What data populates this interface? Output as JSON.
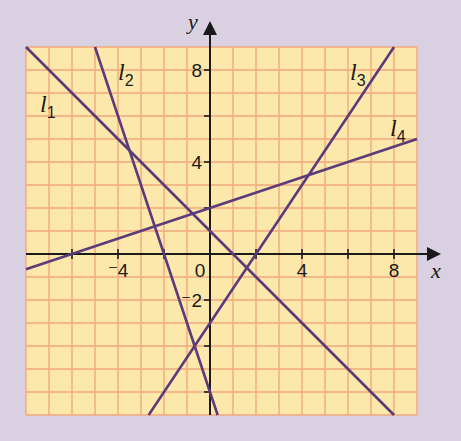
{
  "colors": {
    "background": "#d9d1e1",
    "grid_fill": "#fbe8aa",
    "grid_line": "#f2a97c",
    "axis": "#1a1a1a",
    "plot_line": "#5b3b7c"
  },
  "chart_data": {
    "type": "line",
    "title": "",
    "xlabel": "x",
    "ylabel": "y",
    "xlim": [
      -8,
      9
    ],
    "ylim": [
      -7,
      9
    ],
    "grid": true,
    "x_ticks": [
      -4,
      0,
      4,
      8
    ],
    "x_tick_labels": [
      "⁻4",
      "0",
      "4",
      "8"
    ],
    "y_ticks": [
      -2,
      4,
      8
    ],
    "y_tick_labels": [
      "⁻2",
      "4",
      "8"
    ],
    "series": [
      {
        "name": "l1",
        "label": "l",
        "sub": "1",
        "equation": "y = -x + 1",
        "points": [
          [
            -8,
            9
          ],
          [
            8,
            -7
          ]
        ]
      },
      {
        "name": "l2",
        "label": "l",
        "sub": "2",
        "equation": "y = -3x - 6",
        "points": [
          [
            -5,
            9
          ],
          [
            0.333,
            -7
          ]
        ]
      },
      {
        "name": "l3",
        "label": "l",
        "sub": "3",
        "equation": "y = 1.5x - 3",
        "points": [
          [
            -2.667,
            -7
          ],
          [
            8,
            9
          ]
        ]
      },
      {
        "name": "l4",
        "label": "l",
        "sub": "4",
        "equation": "y = x/3 + 2",
        "points": [
          [
            -8,
            -0.667
          ],
          [
            9,
            5
          ]
        ]
      }
    ]
  }
}
